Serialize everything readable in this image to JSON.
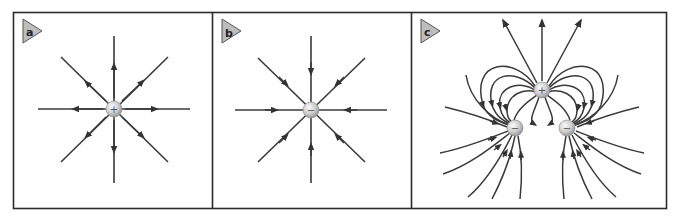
{
  "figure": {
    "colors": {
      "frame": "#2b2b2b",
      "field_line": "#3a3a3a",
      "label_fill": "#bdbdbd",
      "label_stroke": "#555555",
      "charge_light": "#f4f4f4",
      "charge_dark": "#9a9a9a",
      "background": "#ffffff"
    },
    "panels": [
      {
        "id": "a",
        "label": "a",
        "title": "Isolated positive charge",
        "charges": [
          {
            "sign": "+",
            "symbol": "+",
            "x": 114,
            "y": 109
          }
        ],
        "field_direction": "outward",
        "line_count": 8
      },
      {
        "id": "b",
        "label": "b",
        "title": "Isolated negative charge",
        "charges": [
          {
            "sign": "-",
            "symbol": "−",
            "x": 311,
            "y": 109
          }
        ],
        "field_direction": "inward",
        "line_count": 8
      },
      {
        "id": "c",
        "label": "c",
        "title": "One positive and two negative charges",
        "charges": [
          {
            "sign": "+",
            "symbol": "+",
            "x": 542,
            "y": 90
          },
          {
            "sign": "-",
            "symbol": "−",
            "x": 515,
            "y": 128
          },
          {
            "sign": "-",
            "symbol": "−",
            "x": 567,
            "y": 128
          }
        ],
        "field_direction": "from positive to negatives and infinity"
      }
    ]
  }
}
